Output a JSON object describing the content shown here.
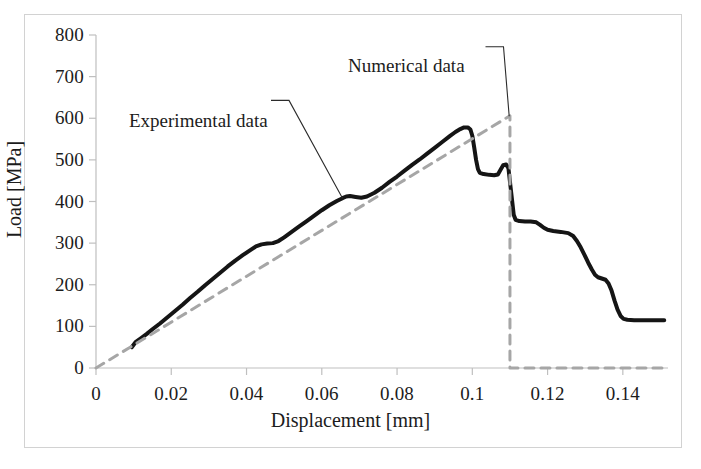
{
  "figure": {
    "background_color": "#ffffff",
    "frame_color": "#d2d2d2"
  },
  "chart_data": {
    "type": "line",
    "title": "",
    "xlabel": "Displacement [mm]",
    "ylabel": "Load [MPa]",
    "xlim": [
      0,
      0.152
    ],
    "ylim": [
      0,
      800
    ],
    "xticks": [
      "0",
      "0.02",
      "0.04",
      "0.06",
      "0.08",
      "0.1",
      "0.12",
      "0.14"
    ],
    "xtick_values": [
      0,
      0.02,
      0.04,
      0.06,
      0.08,
      0.1,
      0.12,
      0.14
    ],
    "yticks": [
      "0",
      "100",
      "200",
      "300",
      "400",
      "500",
      "600",
      "700",
      "800"
    ],
    "ytick_values": [
      0,
      100,
      200,
      300,
      400,
      500,
      600,
      700,
      800
    ],
    "grid": false,
    "legend_position": "inline-annotations",
    "series": [
      {
        "name": "Experimental data",
        "style": "solid",
        "color": "#151515",
        "width": 4.0,
        "points": [
          [
            0.0095,
            50
          ],
          [
            0.0105,
            62
          ],
          [
            0.012,
            72
          ],
          [
            0.0135,
            82
          ],
          [
            0.015,
            93
          ],
          [
            0.017,
            107
          ],
          [
            0.019,
            122
          ],
          [
            0.021,
            137
          ],
          [
            0.023,
            152
          ],
          [
            0.025,
            168
          ],
          [
            0.027,
            183
          ],
          [
            0.029,
            199
          ],
          [
            0.031,
            214
          ],
          [
            0.033,
            229
          ],
          [
            0.035,
            244
          ],
          [
            0.037,
            258
          ],
          [
            0.039,
            271
          ],
          [
            0.041,
            283
          ],
          [
            0.0425,
            292
          ],
          [
            0.044,
            297
          ],
          [
            0.0455,
            299
          ],
          [
            0.047,
            300
          ],
          [
            0.0485,
            305
          ],
          [
            0.05,
            314
          ],
          [
            0.052,
            327
          ],
          [
            0.054,
            340
          ],
          [
            0.056,
            353
          ],
          [
            0.058,
            366
          ],
          [
            0.06,
            379
          ],
          [
            0.062,
            391
          ],
          [
            0.064,
            401
          ],
          [
            0.0655,
            408
          ],
          [
            0.0665,
            412
          ],
          [
            0.0675,
            413
          ],
          [
            0.069,
            411
          ],
          [
            0.0705,
            409
          ],
          [
            0.072,
            412
          ],
          [
            0.074,
            421
          ],
          [
            0.076,
            433
          ],
          [
            0.078,
            447
          ],
          [
            0.08,
            460
          ],
          [
            0.082,
            474
          ],
          [
            0.084,
            488
          ],
          [
            0.086,
            501
          ],
          [
            0.088,
            515
          ],
          [
            0.09,
            529
          ],
          [
            0.092,
            543
          ],
          [
            0.094,
            557
          ],
          [
            0.0955,
            567
          ],
          [
            0.0968,
            574
          ],
          [
            0.0978,
            578
          ],
          [
            0.0988,
            578
          ],
          [
            0.0995,
            573
          ],
          [
            0.1,
            558
          ],
          [
            0.1005,
            530
          ],
          [
            0.101,
            500
          ],
          [
            0.1015,
            478
          ],
          [
            0.102,
            469
          ],
          [
            0.103,
            466
          ],
          [
            0.1045,
            464
          ],
          [
            0.1058,
            463
          ],
          [
            0.1068,
            465
          ],
          [
            0.1075,
            476
          ],
          [
            0.1082,
            487
          ],
          [
            0.109,
            489
          ],
          [
            0.1096,
            480
          ],
          [
            0.1101,
            440
          ],
          [
            0.1106,
            400
          ],
          [
            0.111,
            368
          ],
          [
            0.1115,
            356
          ],
          [
            0.1125,
            353
          ],
          [
            0.114,
            352
          ],
          [
            0.1155,
            352
          ],
          [
            0.117,
            350
          ],
          [
            0.118,
            344
          ],
          [
            0.119,
            337
          ],
          [
            0.12,
            332
          ],
          [
            0.1215,
            329
          ],
          [
            0.1235,
            327
          ],
          [
            0.1255,
            324
          ],
          [
            0.1268,
            317
          ],
          [
            0.1278,
            305
          ],
          [
            0.1288,
            290
          ],
          [
            0.1298,
            272
          ],
          [
            0.1308,
            253
          ],
          [
            0.1318,
            236
          ],
          [
            0.1326,
            224
          ],
          [
            0.1334,
            218
          ],
          [
            0.1344,
            215
          ],
          [
            0.1354,
            212
          ],
          [
            0.1362,
            203
          ],
          [
            0.137,
            186
          ],
          [
            0.1378,
            162
          ],
          [
            0.1386,
            140
          ],
          [
            0.1394,
            125
          ],
          [
            0.1402,
            118
          ],
          [
            0.1412,
            116
          ],
          [
            0.143,
            115
          ],
          [
            0.146,
            115
          ],
          [
            0.149,
            115
          ],
          [
            0.151,
            115
          ]
        ]
      },
      {
        "name": "Numerical data",
        "style": "dashed",
        "color": "#a6a6a6",
        "width": 3.0,
        "points": [
          [
            0.0,
            0
          ],
          [
            0.11,
            606
          ],
          [
            0.11,
            0
          ],
          [
            0.1515,
            0
          ]
        ]
      }
    ],
    "annotations": [
      {
        "text": "Experimental data",
        "target_x": 0.0655,
        "target_y": 408,
        "label_x": 0.0465,
        "label_y": 643
      },
      {
        "text": "Numerical data",
        "target_x": 0.1098,
        "target_y": 605,
        "label_x": 0.1035,
        "label_y": 772
      }
    ]
  }
}
